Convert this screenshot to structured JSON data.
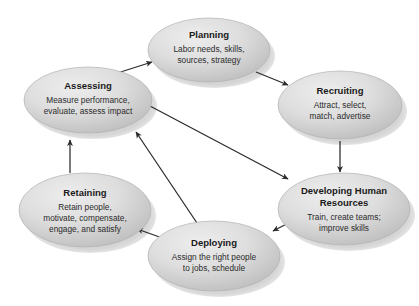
{
  "diagram": {
    "background_color": "#ffffff",
    "node_fill_light": "#e2e2e2",
    "node_fill_dark": "#bdbdbd",
    "node_stroke": "#b2b2b2",
    "shadow_color": "#c9c9c9",
    "connector_color": "#2b2b2b",
    "nodes": [
      {
        "id": "planning",
        "title": "Planning",
        "desc_lines": [
          "Labor needs, skills,",
          "sources, strategy"
        ],
        "cx": 209,
        "cy": 50,
        "rx": 61,
        "ry": 32
      },
      {
        "id": "recruiting",
        "title": "Recruiting",
        "desc_lines": [
          "Attract, select,",
          "match, advertise"
        ],
        "cx": 340,
        "cy": 105,
        "rx": 62,
        "ry": 34
      },
      {
        "id": "developing-human-resources",
        "title_lines": [
          "Developing Human",
          "Resources"
        ],
        "title": "Developing Human Resources",
        "desc_lines": [
          "Train, create teams;",
          "improve skills"
        ],
        "cx": 344,
        "cy": 209,
        "rx": 66,
        "ry": 36
      },
      {
        "id": "deploying",
        "title": "Deploying",
        "desc_lines": [
          "Assign the right people",
          "to jobs, schedule"
        ],
        "cx": 214,
        "cy": 256,
        "rx": 66,
        "ry": 35
      },
      {
        "id": "retaining",
        "title": "Retaining",
        "desc_lines": [
          "Retain people,",
          "motivate, compensate,",
          "engage, and satisfy"
        ],
        "cx": 85,
        "cy": 210,
        "rx": 66,
        "ry": 37
      },
      {
        "id": "assessing",
        "title": "Assessing",
        "desc_lines": [
          "Measure performance,",
          "evaluate, assess impact"
        ],
        "cx": 88,
        "cy": 100,
        "rx": 64,
        "ry": 33
      }
    ],
    "connectors": [
      {
        "id": "assessing-to-planning",
        "from": "assessing",
        "to": "planning",
        "x1": 108,
        "y1": 76,
        "x2": 152,
        "y2": 62
      },
      {
        "id": "planning-to-recruiting",
        "from": "planning",
        "to": "recruiting",
        "x1": 256,
        "y1": 72,
        "x2": 288,
        "y2": 84
      },
      {
        "id": "recruiting-to-developing",
        "from": "recruiting",
        "to": "developing-human-resources",
        "x1": 340,
        "y1": 141,
        "x2": 340,
        "y2": 171
      },
      {
        "id": "developing-to-deploying",
        "from": "developing-human-resources",
        "to": "deploying",
        "x1": 300,
        "y1": 217,
        "x2": 272,
        "y2": 232
      },
      {
        "id": "deploying-to-retaining",
        "from": "deploying",
        "to": "retaining",
        "x1": 168,
        "y1": 240,
        "x2": 137,
        "y2": 228
      },
      {
        "id": "retaining-to-assessing",
        "from": "retaining",
        "to": "assessing",
        "x1": 70,
        "y1": 172,
        "x2": 70,
        "y2": 139
      },
      {
        "id": "assessing-to-developing",
        "from": "assessing",
        "to": "developing-human-resources",
        "x1": 150,
        "y1": 106,
        "x2": 286,
        "y2": 178
      },
      {
        "id": "deploying-to-assessing",
        "from": "deploying",
        "to": "assessing",
        "x1": 200,
        "y1": 228,
        "x2": 135,
        "y2": 131
      }
    ]
  }
}
